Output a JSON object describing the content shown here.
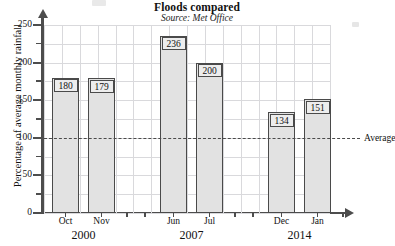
{
  "chart_data": {
    "type": "bar",
    "title": "Floods compared",
    "subtitle": "Source: Met Office",
    "xlabel": "",
    "ylabel": "Percentage of average monthly rainfall",
    "ylim": [
      0,
      250
    ],
    "ytick_labels": [
      "0",
      "50",
      "100",
      "150",
      "200",
      "250"
    ],
    "ytick_values": [
      0,
      50,
      100,
      150,
      200,
      250
    ],
    "yminor_step": 25,
    "grid": true,
    "legend": "none",
    "categories": [
      "Oct",
      "Nov",
      "Jun",
      "Jul",
      "Dec",
      "Jan"
    ],
    "values": [
      180,
      179,
      236,
      200,
      134,
      151
    ],
    "value_labels": [
      "180",
      "179",
      "236",
      "200",
      "134",
      "151"
    ],
    "groups": [
      {
        "year": "2000",
        "categories": [
          "Oct",
          "Nov"
        ],
        "values": [
          180,
          179
        ]
      },
      {
        "year": "2007",
        "categories": [
          "Jun",
          "Jul"
        ],
        "values": [
          236,
          200
        ]
      },
      {
        "year": "2014",
        "categories": [
          "Dec",
          "Jan"
        ],
        "values": [
          134,
          151
        ]
      }
    ],
    "annotations": [
      {
        "name": "average-line",
        "label": "Average",
        "y_value": 100,
        "style": "dashed"
      }
    ],
    "colors": {
      "bar_fill": "#e2e2e2",
      "bar_stroke": "#4a4a4a",
      "axis": "#4d4d4d",
      "grid": "#d9d9dc",
      "text": "#111111"
    }
  }
}
